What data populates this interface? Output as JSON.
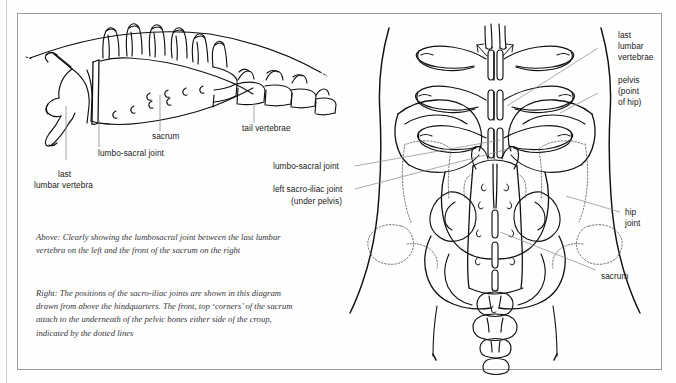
{
  "figure": {
    "frame_color": "#9a9a9a",
    "ink_color": "#111111",
    "label_color": "#1a1a1a",
    "caption_color": "#35353a"
  },
  "left_diagram": {
    "name": "sacrum-side-view",
    "labels": [
      {
        "id": "tail-vertebrae",
        "text": "tail vertebrae"
      },
      {
        "id": "sacrum",
        "text": "sacrum"
      },
      {
        "id": "lumbo-sacral-joint",
        "text": "lumbo-sacral joint"
      },
      {
        "id": "last-lumbar-vertebra-line1",
        "text": "last"
      },
      {
        "id": "last-lumbar-vertebra-line2",
        "text": "lumbar vertebra"
      }
    ]
  },
  "right_diagram": {
    "name": "pelvis-from-above-view",
    "labels": [
      {
        "id": "last-lumbar-vertebrae-line1",
        "text": "last"
      },
      {
        "id": "last-lumbar-vertebrae-line2",
        "text": "lumbar"
      },
      {
        "id": "last-lumbar-vertebrae-line3",
        "text": "vertebrae"
      },
      {
        "id": "pelvis-line1",
        "text": "pelvis"
      },
      {
        "id": "pelvis-line2",
        "text": "(point"
      },
      {
        "id": "pelvis-line3",
        "text": "of hip)"
      },
      {
        "id": "lumbo-sacral-joint",
        "text": "lumbo-sacral joint"
      },
      {
        "id": "left-sacro-iliac-joint",
        "text": "left sacro-iliac joint"
      },
      {
        "id": "left-sacro-iliac-joint-sub",
        "text": "(under pelvis)"
      },
      {
        "id": "hip-joint-line1",
        "text": "hip"
      },
      {
        "id": "hip-joint-line2",
        "text": "joint"
      },
      {
        "id": "sacrum",
        "text": "sacrum"
      }
    ]
  },
  "captions": {
    "above": {
      "lead": "Above:",
      "body": " Clearly showing the lumbosacral joint between the last lumbar vertebra on the left and the front of the sacrum on the right"
    },
    "right": {
      "lead": "Right:",
      "body": " The positions of the sacro-iliac joints are shown in this diagram drawn from above the hindquarters. The front, top ‘corners’ of the sacrum attach to the underneath of the pelvic bones either side of the croup, indicated by the dotted lines"
    }
  }
}
